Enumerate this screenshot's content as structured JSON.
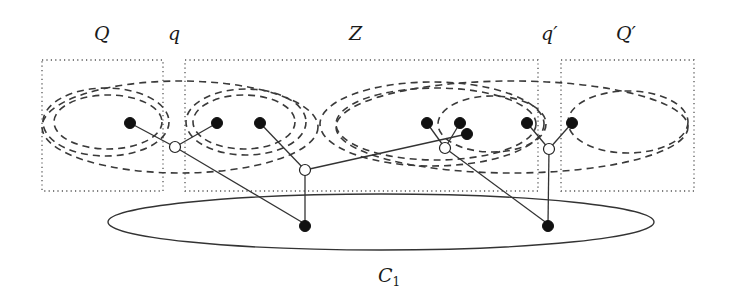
{
  "diagram": {
    "labels": {
      "Q": "Q",
      "q": "q",
      "Z": "Z",
      "q_prime": "q′",
      "Q_prime": "Q′",
      "C1_main": "C",
      "C1_sub": "1"
    },
    "regions": [
      {
        "name": "Q",
        "style": "dotted-box"
      },
      {
        "name": "Z",
        "style": "dotted-box"
      },
      {
        "name": "Q′",
        "style": "dotted-box"
      }
    ],
    "dashed_ellipses": 10,
    "cluster": {
      "name": "C1",
      "style": "solid-ellipse"
    },
    "nodes": {
      "filled_count": 10,
      "open_count": 4
    },
    "colors": {
      "ink": "#111111",
      "background": "#ffffff"
    }
  }
}
